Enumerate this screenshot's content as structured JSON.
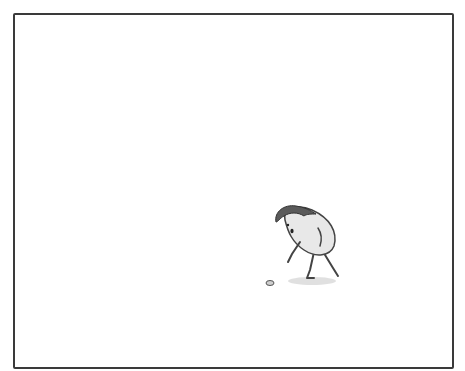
{
  "panel": {
    "description": "Single comic panel with empty white space; a small bean-shaped character bends over looking at a small round object on the ground",
    "colors": {
      "border": "#3a3a3a",
      "background": "#ffffff",
      "character_body": "#e6e6e6",
      "character_hair": "#5a5a5a",
      "shadow": "#d8d8d8"
    }
  },
  "character": {
    "name": "bean-shaped character",
    "pose": "leaning forward, arm reaching down",
    "expression": "surprised, open mouth"
  },
  "object": {
    "name": "small coin or pebble on the ground"
  }
}
